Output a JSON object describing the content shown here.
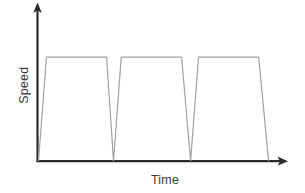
{
  "chart_data": {
    "type": "line",
    "title": "",
    "xlabel": "Time",
    "ylabel": "Speed",
    "xlim": [
      0,
      100
    ],
    "ylim": [
      0,
      100
    ],
    "grid": false,
    "legend": null,
    "xticks": [],
    "yticks": [],
    "axis_arrows": {
      "x": "right-arrow",
      "y": "up-arrow"
    },
    "series": [
      {
        "name": "Speed",
        "color": "#a3a3a3",
        "points": [
          {
            "x": 0.4,
            "y": 0
          },
          {
            "x": 3.6,
            "y": 100
          },
          {
            "x": 27.8,
            "y": 100
          },
          {
            "x": 30.6,
            "y": 0
          },
          {
            "x": 33.7,
            "y": 100
          },
          {
            "x": 58.0,
            "y": 100
          },
          {
            "x": 61.6,
            "y": 0
          },
          {
            "x": 64.8,
            "y": 100
          },
          {
            "x": 89.0,
            "y": 100
          },
          {
            "x": 93.0,
            "y": 0
          }
        ]
      }
    ],
    "cycles": [
      {
        "label": "cycle-1",
        "accelerate_from": 0.4,
        "plateau_start": 3.6,
        "plateau_end": 27.8,
        "decelerate_to": 30.6,
        "peak": 100
      },
      {
        "label": "cycle-2",
        "accelerate_from": 30.6,
        "plateau_start": 33.7,
        "plateau_end": 58.0,
        "decelerate_to": 61.6,
        "peak": 100
      },
      {
        "label": "cycle-3",
        "accelerate_from": 61.6,
        "plateau_start": 64.8,
        "plateau_end": 89.0,
        "decelerate_to": 93.0,
        "peak": 100
      }
    ]
  },
  "colors": {
    "axis": "#2b2b2b",
    "curve": "#a3a3a3",
    "background": "#ffffff",
    "label_text": "#3a3a3a"
  },
  "geometry": {
    "origin_x": 37.5,
    "baseline_y": 161,
    "plateau_y": 57,
    "y_axis_top": 4,
    "x_axis_right": 286,
    "curve_path": "M 38.5 161 L 46.5 57 L 107 57 L 114 161 L 122 57 L 183 57 L 192 161 L 200 57 L 261 57 L 270.5 161"
  }
}
